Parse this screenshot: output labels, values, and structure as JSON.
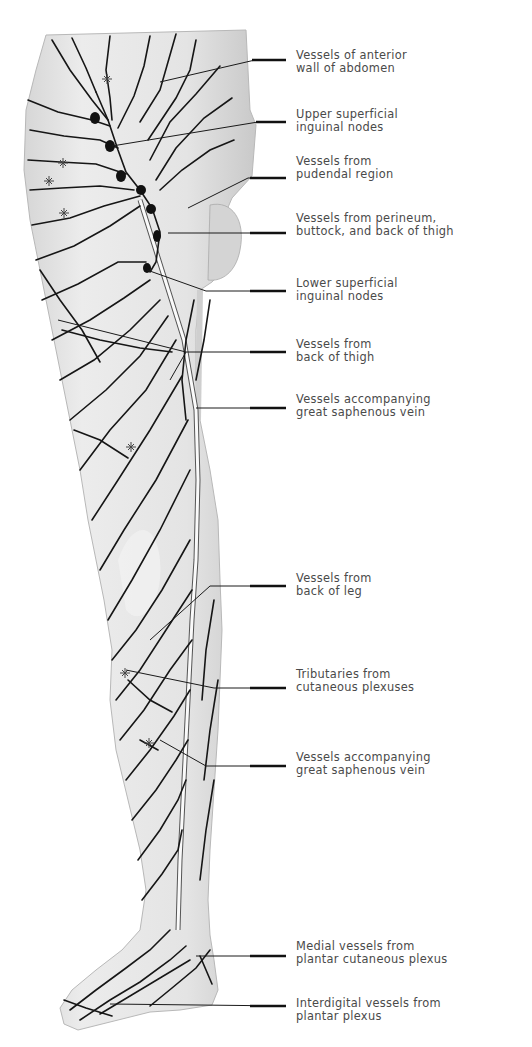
{
  "figure": {
    "colors": {
      "skin": "#e6e6e6",
      "skin_shadow": "#cfcfcf",
      "vessel": "#161616",
      "label_text": "#4a4a4a",
      "leader_line": "#1a1a1a"
    }
  },
  "labels": [
    {
      "id": "anterior-abdomen",
      "line1": "Vessels of anterior",
      "line2": "wall of abdomen",
      "top": 16,
      "pointer_y": 33
    },
    {
      "id": "upper-superficial-inguinal",
      "line1": "Upper superficial",
      "line2": "inguinal nodes",
      "top": 106,
      "pointer_y": 122
    },
    {
      "id": "pudendal-region",
      "line1": "Vessels from",
      "line2": "pudendal region",
      "top": 155,
      "pointer_y": 178
    },
    {
      "id": "perineum-buttock",
      "line1": "Vessels from perineum,",
      "line2": "buttock, and back of thigh",
      "top": 210,
      "pointer_y": 232
    },
    {
      "id": "lower-superficial-inguinal",
      "line1": "Lower superficial",
      "line2": "inguinal nodes",
      "top": 276,
      "pointer_y": 291
    },
    {
      "id": "back-of-thigh",
      "line1": "Vessels from",
      "line2": "back of thigh",
      "top": 334,
      "pointer_y": 350
    },
    {
      "id": "great-saphenous-upper",
      "line1": "Vessels accompanying",
      "line2": "great saphenous vein",
      "top": 392,
      "pointer_y": 407
    },
    {
      "id": "back-of-leg",
      "line1": "Vessels from",
      "line2": "back of leg",
      "top": 567,
      "pointer_y": 584
    },
    {
      "id": "cutaneous-plexuses",
      "line1": "Tributaries from",
      "line2": "cutaneous plexuses",
      "top": 664,
      "pointer_y": 687
    },
    {
      "id": "great-saphenous-lower",
      "line1": "Vessels accompanying",
      "line2": "great saphenous vein",
      "top": 746,
      "pointer_y": 765
    },
    {
      "id": "plantar-cutaneous",
      "line1": "Medial vessels from",
      "line2": "plantar cutaneous plexus",
      "top": 935,
      "pointer_y": 955
    },
    {
      "id": "interdigital",
      "line1": "Interdigital vessels from",
      "line2": "plantar plexus",
      "top": 993,
      "pointer_y": 1004
    }
  ]
}
